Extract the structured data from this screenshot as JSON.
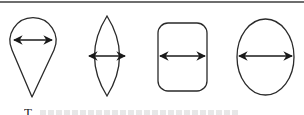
{
  "figure": {
    "type": "shape-comparison-diagram",
    "stroke_color": "#2a2a2a",
    "rule_color": "#6e6e6e",
    "background": "#ffffff",
    "shapes": [
      {
        "id": "teardrop",
        "label": "teardrop",
        "arrow": "horizontal double-headed width arrow"
      },
      {
        "id": "lens",
        "label": "lens / vesica",
        "arrow": "horizontal double-headed width arrow"
      },
      {
        "id": "rounded-rectangle",
        "label": "rounded rectangle",
        "arrow": "horizontal double-headed width arrow"
      },
      {
        "id": "ellipse",
        "label": "ellipse",
        "arrow": "horizontal double-headed width arrow"
      }
    ]
  },
  "caption": {
    "visible_text": "T"
  }
}
